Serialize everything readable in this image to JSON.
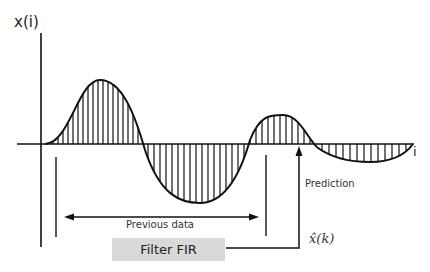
{
  "diagram": {
    "y_axis_label": "x(i)",
    "x_axis_label": "i",
    "previous_data_label": "Previous data",
    "prediction_label": "Prediction",
    "output_label": "x̂(k)",
    "filter_box_label": "Filter FIR",
    "colors": {
      "line": "#111111",
      "filter_box_fill": "#d9d9d9",
      "background": "#ffffff"
    }
  }
}
